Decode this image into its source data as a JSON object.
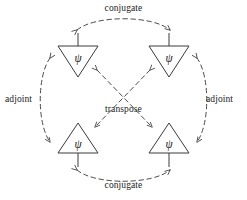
{
  "diagram": {
    "stroke_color": "#3a3a3a",
    "dash_color": "#4a4a4a",
    "background": "#ffffff",
    "labels": {
      "conjugate_top": "conjugate",
      "conjugate_bottom": "conjugate",
      "adjoint_left": "adjoint",
      "adjoint_right": "adjoint",
      "transpose": "transpose"
    },
    "nodes": [
      {
        "id": "top-left",
        "symbol": "ψ",
        "orientation": "down",
        "wire": "up",
        "cx": 78,
        "cy": 59
      },
      {
        "id": "top-right",
        "symbol": "ψ",
        "orientation": "down",
        "wire": "up",
        "cx": 169,
        "cy": 59
      },
      {
        "id": "bottom-left",
        "symbol": "ψ",
        "orientation": "up",
        "wire": "down",
        "cx": 78,
        "cy": 140
      },
      {
        "id": "bottom-right",
        "symbol": "ψ",
        "orientation": "up",
        "wire": "down",
        "cx": 169,
        "cy": 140
      }
    ],
    "edges": [
      {
        "id": "conjugate-top",
        "label": "conjugate",
        "style": "dashed",
        "arrows": "both",
        "from": "top-left",
        "to": "top-right"
      },
      {
        "id": "conjugate-bottom",
        "label": "conjugate",
        "style": "dashed",
        "arrows": "both",
        "from": "bottom-left",
        "to": "bottom-right"
      },
      {
        "id": "adjoint-left",
        "label": "adjoint",
        "style": "dashed",
        "arrows": "both",
        "from": "top-left",
        "to": "bottom-left"
      },
      {
        "id": "adjoint-right",
        "label": "adjoint",
        "style": "dashed",
        "arrows": "both",
        "from": "top-right",
        "to": "bottom-right"
      },
      {
        "id": "transpose-a",
        "label": "transpose",
        "style": "dashed",
        "arrows": "both",
        "from": "top-left",
        "to": "bottom-right"
      },
      {
        "id": "transpose-b",
        "label": "transpose",
        "style": "dashed",
        "arrows": "both",
        "from": "top-right",
        "to": "bottom-left"
      }
    ]
  }
}
